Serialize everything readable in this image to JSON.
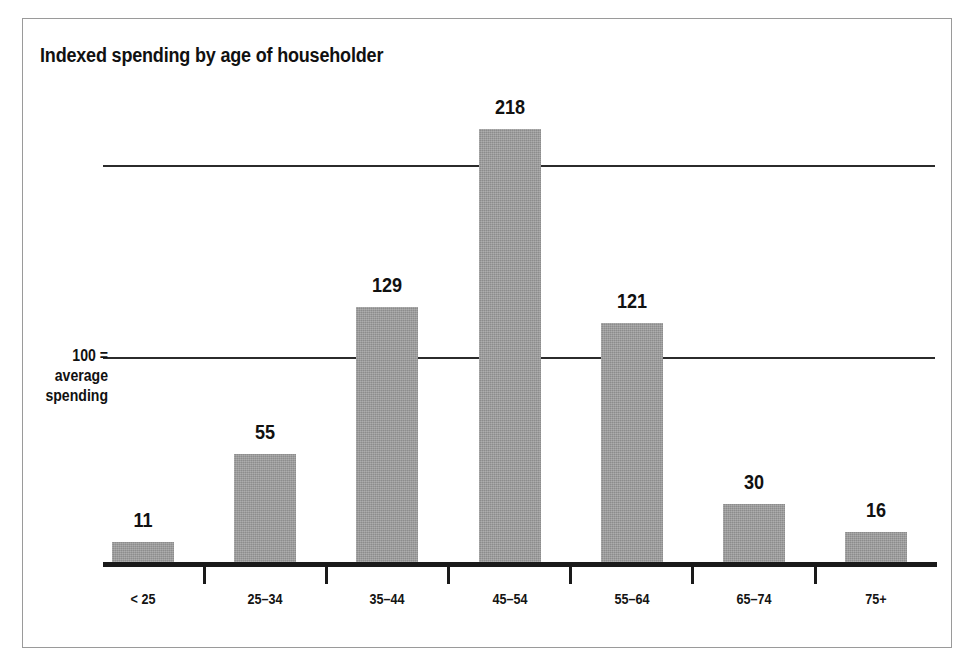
{
  "figure": {
    "title": "Indexed spending by age of householder",
    "frame_color": "#9a9a9a",
    "background": "#ffffff"
  },
  "yaxis_note": {
    "line1": "100 =",
    "line2": "average",
    "line3": "spending"
  },
  "chart_data": {
    "type": "bar",
    "title": "Indexed spending by age of householder",
    "xlabel": "",
    "ylabel": "100 = average spending",
    "categories": [
      "< 25",
      "25–34",
      "35–44",
      "45–54",
      "55–64",
      "65–74",
      "75+"
    ],
    "values": [
      11,
      55,
      129,
      218,
      121,
      30,
      16
    ],
    "value_labels": [
      "11",
      "55",
      "129",
      "218",
      "121",
      "30",
      "16"
    ],
    "ylim": [
      0,
      230
    ],
    "gridlines": [
      100,
      200
    ],
    "grid": true,
    "legend": "none",
    "bar_color": "#9c9c9c",
    "axis_color": "#1a1a1a"
  }
}
